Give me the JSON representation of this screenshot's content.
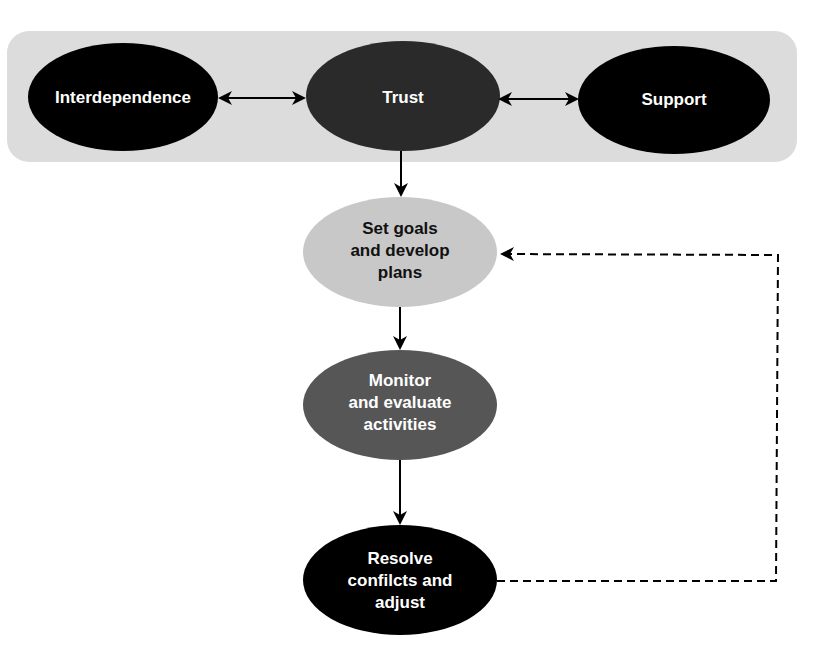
{
  "diagram": {
    "top_band": {
      "color": "#dcdcdc",
      "nodes": [
        {
          "id": "interdependence",
          "label": "Interdependence",
          "fill": "#000000",
          "text_color": "#ffffff"
        },
        {
          "id": "trust",
          "label": "Trust",
          "fill": "#2a2a2a",
          "text_color": "#ffffff"
        },
        {
          "id": "support",
          "label": "Support",
          "fill": "#000000",
          "text_color": "#ffffff"
        }
      ]
    },
    "flow": [
      {
        "id": "set-goals",
        "label": "Set goals\nand develop\nplans",
        "fill": "#c8c8c8",
        "text_color": "#111111"
      },
      {
        "id": "monitor",
        "label": "Monitor\nand evaluate\nactivities",
        "fill": "#565656",
        "text_color": "#ffffff"
      },
      {
        "id": "resolve",
        "label": "Resolve\nconfilcts and\nadjust",
        "fill": "#000000",
        "text_color": "#ffffff"
      }
    ],
    "edges": [
      {
        "from": "interdependence",
        "to": "trust",
        "type": "bidirectional"
      },
      {
        "from": "trust",
        "to": "support",
        "type": "bidirectional"
      },
      {
        "from": "trust",
        "to": "set-goals",
        "type": "solid"
      },
      {
        "from": "set-goals",
        "to": "monitor",
        "type": "solid"
      },
      {
        "from": "monitor",
        "to": "resolve",
        "type": "solid"
      },
      {
        "from": "resolve",
        "to": "set-goals",
        "type": "dashed-feedback"
      }
    ]
  }
}
